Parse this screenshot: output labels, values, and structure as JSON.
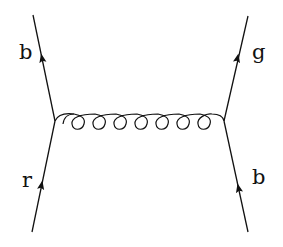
{
  "diagram": {
    "type": "feynman",
    "line_color": "#111111",
    "labels": {
      "top_left": "b",
      "bottom_left": "r",
      "top_right": "g",
      "bottom_right": "b"
    },
    "vertices": [
      {
        "id": "left",
        "x": 55,
        "y": 121
      },
      {
        "id": "right",
        "x": 224,
        "y": 121
      }
    ],
    "fermion_lines": [
      {
        "id": "incoming-left",
        "from": [
          32,
          232
        ],
        "to": [
          55,
          121
        ],
        "label": "r"
      },
      {
        "id": "outgoing-left",
        "from": [
          55,
          121
        ],
        "to": [
          33,
          15
        ],
        "label": "b"
      },
      {
        "id": "incoming-right",
        "from": [
          248,
          232
        ],
        "to": [
          224,
          121
        ],
        "label": "b"
      },
      {
        "id": "outgoing-right",
        "from": [
          224,
          121
        ],
        "to": [
          248,
          16
        ],
        "label": "g"
      }
    ],
    "gluon": {
      "from": "left",
      "to": "right",
      "loops": 8
    }
  }
}
